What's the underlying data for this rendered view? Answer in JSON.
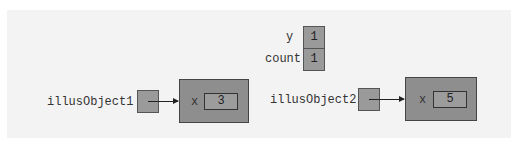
{
  "static_vars": [
    {
      "name": "y",
      "value": "1"
    },
    {
      "name": "count",
      "value": "1"
    }
  ],
  "references": [
    {
      "name": "illusObject1",
      "field": "x",
      "value": "3"
    },
    {
      "name": "illusObject2",
      "field": "x",
      "value": "5"
    }
  ],
  "colors": {
    "background": "#f3f3f3",
    "cell_fill": "#9a9a9a",
    "object_fill": "#8e8e8e"
  }
}
